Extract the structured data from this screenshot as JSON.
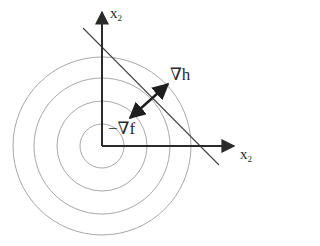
{
  "diagram": {
    "type": "contour-plot-with-constraint",
    "colors": {
      "axis": "#2a2a2a",
      "contour": "#a8a8a8",
      "constraint_line": "#444444",
      "arrow": "#1e1e1e",
      "background": "#ffffff"
    },
    "origin": {
      "x": 102,
      "y": 146
    },
    "contour_radii": [
      22,
      45,
      68,
      89
    ],
    "axes": {
      "vertical": {
        "label_main": "x",
        "label_sub": "2"
      },
      "horizontal": {
        "label_main": "x",
        "label_sub": "2"
      }
    },
    "constraint_line": {
      "x1": 83,
      "y1": 28,
      "x2": 219,
      "y2": 165
    },
    "gradient_arrow": {
      "x1": 130,
      "y1": 118,
      "x2": 168,
      "y2": 84
    },
    "labels": {
      "grad_h": "∇h",
      "neg_grad_f": "−∇f"
    }
  }
}
